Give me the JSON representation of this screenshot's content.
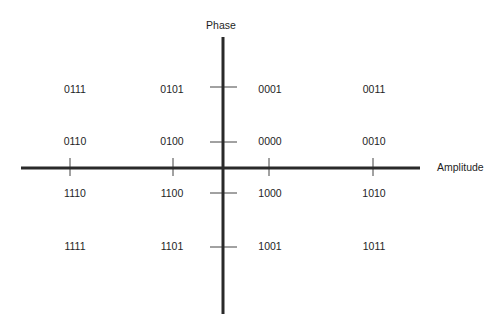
{
  "diagram": {
    "axes": {
      "vertical_label": "Phase",
      "horizontal_label": "Amplitude"
    },
    "columns": [
      "-2",
      "-1",
      "1",
      "2"
    ],
    "rows": [
      "2",
      "1",
      "-1",
      "-2"
    ],
    "points": [
      {
        "row": 0,
        "col": 0,
        "code": "0111"
      },
      {
        "row": 0,
        "col": 1,
        "code": "0101"
      },
      {
        "row": 0,
        "col": 2,
        "code": "0001"
      },
      {
        "row": 0,
        "col": 3,
        "code": "0011"
      },
      {
        "row": 1,
        "col": 0,
        "code": "0110"
      },
      {
        "row": 1,
        "col": 1,
        "code": "0100"
      },
      {
        "row": 1,
        "col": 2,
        "code": "0000"
      },
      {
        "row": 1,
        "col": 3,
        "code": "0010"
      },
      {
        "row": 2,
        "col": 0,
        "code": "1110"
      },
      {
        "row": 2,
        "col": 1,
        "code": "1100"
      },
      {
        "row": 2,
        "col": 2,
        "code": "1000"
      },
      {
        "row": 2,
        "col": 3,
        "code": "1010"
      },
      {
        "row": 3,
        "col": 0,
        "code": "1111"
      },
      {
        "row": 3,
        "col": 1,
        "code": "1101"
      },
      {
        "row": 3,
        "col": 2,
        "code": "1001"
      },
      {
        "row": 3,
        "col": 3,
        "code": "1011"
      }
    ],
    "colors": {
      "axis": "#2a2a2a",
      "text": "#1e1e1e",
      "background": "#ffffff"
    }
  }
}
